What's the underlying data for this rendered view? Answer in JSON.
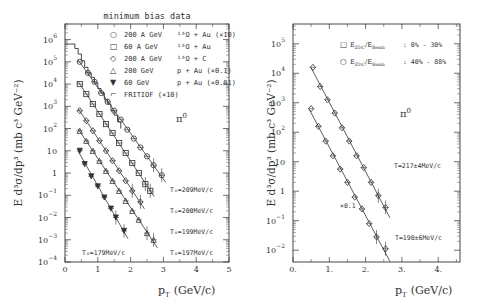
{
  "chart_data": [
    {
      "type": "scatter",
      "panel": "left",
      "title": "minimum bias data",
      "xlabel": "p_T (GeV/c)",
      "ylabel": "E d^3σ/dp^3 (mb c^3 GeV^-2)",
      "xlim": [
        0,
        5
      ],
      "ylim_log10": [
        -4,
        6.7
      ],
      "x_ticks": [
        "0",
        "1",
        "2",
        "3",
        "4",
        "5"
      ],
      "y_ticks": [
        "10^6",
        "10^5",
        "10^4",
        "10^3",
        "10^2",
        "10",
        "1",
        "10^-1",
        "10^-2",
        "10^-3",
        "10^-4"
      ],
      "annotation": "π0",
      "legend": [
        {
          "marker": "circle",
          "label": "200 A GeV",
          "reaction": "16O + Au",
          "scale": "(×10)"
        },
        {
          "marker": "square",
          "label": "60 A GeV",
          "reaction": "16O + Au",
          "scale": ""
        },
        {
          "marker": "diamond",
          "label": "200 A GeV",
          "reaction": "16O + C",
          "scale": ""
        },
        {
          "marker": "triangle",
          "label": "200 GeV",
          "reaction": "p + Au",
          "scale": "(×0.1)"
        },
        {
          "marker": "filled-triangle-down",
          "label": "60 GeV",
          "reaction": "p + Au",
          "scale": "(×0.01)"
        },
        {
          "marker": "histogram",
          "label": "FRITIOF (×10)",
          "reaction": "",
          "scale": ""
        }
      ],
      "series": [
        {
          "name": "200 A GeV 16O+Au (×10)",
          "T0": "T0=209MeV/c",
          "x": [
            0.45,
            0.7,
            0.9,
            1.1,
            1.3,
            1.5,
            1.7,
            1.9,
            2.1,
            2.3,
            2.5,
            2.7,
            2.95
          ],
          "log10y": [
            5.0,
            4.5,
            4.1,
            3.6,
            3.2,
            2.8,
            2.4,
            1.95,
            1.55,
            1.15,
            0.75,
            0.35,
            -0.1
          ]
        },
        {
          "name": "60 A GeV 16O+Au",
          "T0": "T0=200MeV/c",
          "x": [
            0.45,
            0.65,
            0.85,
            1.05,
            1.25,
            1.45,
            1.65,
            1.85,
            2.05,
            2.25,
            2.45,
            2.6
          ],
          "log10y": [
            4.0,
            3.55,
            3.1,
            2.65,
            2.2,
            1.8,
            1.35,
            0.9,
            0.45,
            0.0,
            -0.5,
            -0.8
          ]
        },
        {
          "name": "200 A GeV 16O+C",
          "T0": "T0=199MeV/c",
          "x": [
            0.45,
            0.65,
            0.85,
            1.05,
            1.25,
            1.45,
            1.65,
            1.85,
            2.05,
            2.3
          ],
          "log10y": [
            2.8,
            2.35,
            1.9,
            1.45,
            1.0,
            0.55,
            0.1,
            -0.35,
            -0.8,
            -1.3
          ]
        },
        {
          "name": "200 GeV p+Au (×0.1)",
          "T0": "T0=197MeV/c",
          "x": [
            0.45,
            0.65,
            0.85,
            1.05,
            1.25,
            1.45,
            1.65,
            1.85,
            2.05,
            2.25,
            2.5,
            2.7
          ],
          "log10y": [
            1.9,
            1.45,
            1.0,
            0.55,
            0.1,
            -0.35,
            -0.8,
            -1.25,
            -1.7,
            -2.1,
            -2.7,
            -3.0
          ]
        },
        {
          "name": "60 GeV p+Au (×0.01)",
          "T0": "T0=179MeV/c",
          "x": [
            0.45,
            0.6,
            0.8,
            1.0,
            1.2,
            1.4,
            1.55,
            1.8
          ],
          "log10y": [
            1.0,
            0.4,
            -0.15,
            -0.6,
            -1.1,
            -1.6,
            -2.0,
            -2.6
          ]
        },
        {
          "name": "FRITIOF (×10)",
          "type": "step",
          "x": [
            0.0,
            0.1,
            0.2,
            0.3,
            0.4,
            0.5,
            0.6,
            0.7,
            0.8,
            0.9,
            1.0,
            1.1,
            1.2,
            1.3,
            1.4,
            1.5,
            1.6,
            1.7
          ],
          "log10y": [
            5.8,
            5.8,
            5.8,
            5.6,
            5.35,
            5.05,
            4.75,
            4.5,
            4.3,
            4.05,
            3.8,
            3.6,
            3.3,
            3.1,
            2.8,
            2.6,
            2.3,
            2.0
          ]
        }
      ]
    },
    {
      "type": "scatter",
      "panel": "right",
      "title": "",
      "xlabel": "p_T (GeV/c)",
      "ylabel": "E d^3σ/dp^3 (mb c^3 GeV^-2)",
      "xlim": [
        0,
        4.6
      ],
      "ylim_log10": [
        -2.4,
        5.67
      ],
      "x_ticks": [
        "0.",
        "1.",
        "2.",
        "3.",
        "4."
      ],
      "y_ticks": [
        "10^5",
        "10^4",
        "10^3",
        "10^2",
        "10",
        "1",
        "10^-1",
        "10^-2"
      ],
      "annotation": "π0",
      "legend": [
        {
          "marker": "square",
          "label": "E_ZDC/E_Beam",
          "range": "0% - 30%"
        },
        {
          "marker": "circle",
          "label": "E_ZDC/E_Beam",
          "range": "40% - 88%"
        }
      ],
      "series": [
        {
          "name": "E_ZDC/E_Beam 0%-30%",
          "T": "T=217±4MeV/c",
          "x": [
            0.55,
            0.75,
            0.95,
            1.15,
            1.35,
            1.55,
            1.75,
            1.95,
            2.15,
            2.35,
            2.55
          ],
          "log10y": [
            4.2,
            3.55,
            3.1,
            2.65,
            2.15,
            1.7,
            1.2,
            0.8,
            0.3,
            -0.15,
            -0.55
          ]
        },
        {
          "name": "E_ZDC/E_Beam 40%-88% (×0.1)",
          "T": "T=190±6MeV/c",
          "scale": "×0.1",
          "x": [
            0.5,
            0.7,
            0.9,
            1.1,
            1.3,
            1.5,
            1.7,
            1.9,
            2.1,
            2.3,
            2.55
          ],
          "log10y": [
            2.8,
            2.2,
            1.7,
            1.2,
            0.75,
            0.3,
            -0.2,
            -0.6,
            -1.1,
            -1.55,
            -1.95
          ]
        }
      ]
    }
  ],
  "labels": {
    "left_title": "minimum bias data",
    "pi0": "π",
    "pi0_sup": "0",
    "x_axis": "p",
    "x_axis_sub": "T",
    "x_axis_unit": "(GeV/c)",
    "y_axis": "E  d³σ/dp³  (mb  c³  GeV⁻²)",
    "left_T0": [
      "T₀=209MeV/c",
      "T₀=200MeV/c",
      "T₀=199MeV/c",
      "T₀=197MeV/c",
      "T₀=179MeV/c"
    ],
    "right_T": [
      "T=217±4MeV/c",
      "T=190±6MeV/c"
    ],
    "right_scale": "×0.1",
    "left_legend": [
      {
        "sym": "○",
        "energy": "200 A GeV",
        "reaction": "¹⁶O + Au  (×10)"
      },
      {
        "sym": "□",
        "energy": " 60 A GeV",
        "reaction": "¹⁶O + Au"
      },
      {
        "sym": "◇",
        "energy": "200 A GeV",
        "reaction": "¹⁶O + C"
      },
      {
        "sym": "△",
        "energy": "200 GeV",
        "reaction": "  p + Au  (×0.1)"
      },
      {
        "sym": "▼",
        "energy": " 60 GeV",
        "reaction": "  p + Au  (×0.01)"
      },
      {
        "sym": "⌐",
        "energy": "FRITIOF (×10)",
        "reaction": ""
      }
    ],
    "right_legend": [
      {
        "sym": "□",
        "label": "E",
        "sub1": "ZDC",
        "mid": "/E",
        "sub2": "Beam",
        "range": ":  0%  -  30%"
      },
      {
        "sym": "○",
        "label": "E",
        "sub1": "ZDC",
        "mid": "/E",
        "sub2": "Beam",
        "range": ": 40%  -  88%"
      }
    ]
  }
}
